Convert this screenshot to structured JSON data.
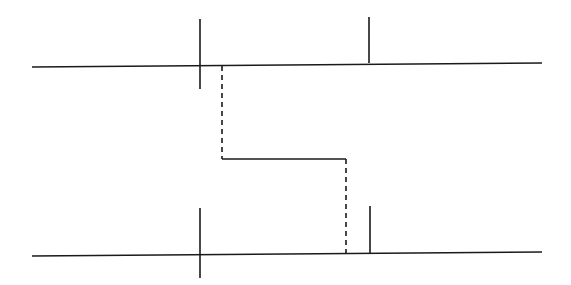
{
  "diagram": {
    "width": 571,
    "height": 285,
    "background": "#ffffff",
    "stroke_color": "#1a1a1a",
    "stroke_width": 1.6,
    "top_axis": {
      "line": {
        "x1": 32,
        "y1": 67,
        "x2": 542,
        "y2": 63
      },
      "left_tick": {
        "x1": 200,
        "y1": 19,
        "x2": 200,
        "y2": 89
      },
      "right_tick": {
        "x1": 369,
        "y1": 17,
        "x2": 369,
        "y2": 63
      }
    },
    "bottom_axis": {
      "line": {
        "x1": 32,
        "y1": 256,
        "x2": 542,
        "y2": 252
      },
      "left_tick": {
        "x1": 200,
        "y1": 208,
        "x2": 200,
        "y2": 278
      },
      "right_tick": {
        "x1": 370,
        "y1": 206,
        "x2": 370,
        "y2": 253
      }
    },
    "connector": {
      "dashed_left": {
        "x1": 222,
        "y1": 66,
        "x2": 222,
        "y2": 159
      },
      "solid_middle": {
        "x1": 222,
        "y1": 159,
        "x2": 346,
        "y2": 159
      },
      "dashed_right": {
        "x1": 346,
        "y1": 159,
        "x2": 346,
        "y2": 254
      },
      "dash_pattern": "5,4"
    }
  }
}
